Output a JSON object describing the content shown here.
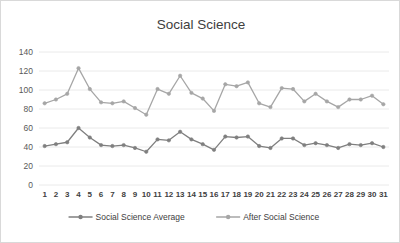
{
  "chart_data": {
    "type": "line",
    "title": "Social Science",
    "xlabel": "",
    "ylabel": "",
    "x": [
      1,
      2,
      3,
      4,
      5,
      6,
      7,
      8,
      9,
      10,
      11,
      12,
      13,
      14,
      15,
      16,
      17,
      18,
      19,
      20,
      21,
      22,
      23,
      24,
      25,
      26,
      27,
      28,
      29,
      30,
      31
    ],
    "categories": [
      "1",
      "2",
      "3",
      "4",
      "5",
      "6",
      "7",
      "8",
      "9",
      "10",
      "11",
      "12",
      "13",
      "14",
      "15",
      "16",
      "17",
      "18",
      "19",
      "20",
      "21",
      "22",
      "23",
      "24",
      "25",
      "26",
      "27",
      "28",
      "29",
      "30",
      "31"
    ],
    "ylim": [
      0,
      140
    ],
    "ytick_labels": [
      "140",
      "120",
      "100",
      "80",
      "60",
      "40",
      "20",
      "0"
    ],
    "yticks": [
      140,
      120,
      100,
      80,
      60,
      40,
      20,
      0
    ],
    "grid": true,
    "legend_position": "bottom",
    "series": [
      {
        "name": "Social Science Average",
        "color": "#7f7f7f",
        "marker": "circle",
        "values": [
          41,
          43,
          45,
          60,
          50,
          42,
          41,
          42,
          39,
          35,
          48,
          47,
          56,
          48,
          43,
          37,
          51,
          50,
          51,
          41,
          39,
          49,
          49,
          42,
          44,
          42,
          39,
          43,
          42,
          44,
          40
        ]
      },
      {
        "name": "After  Social Science",
        "color": "#a6a6a6",
        "marker": "circle",
        "values": [
          86,
          90,
          96,
          123,
          101,
          87,
          86,
          88,
          81,
          74,
          101,
          96,
          115,
          97,
          91,
          78,
          106,
          104,
          108,
          86,
          82,
          102,
          101,
          88,
          96,
          88,
          82,
          90,
          90,
          94,
          85
        ]
      }
    ]
  },
  "colors": {
    "grid": "#e4e4e4",
    "series_1": "#7f7f7f",
    "series_2": "#a6a6a6",
    "title_text": "#404040",
    "axis_text": "#595959",
    "border": "#d9d9d9"
  }
}
